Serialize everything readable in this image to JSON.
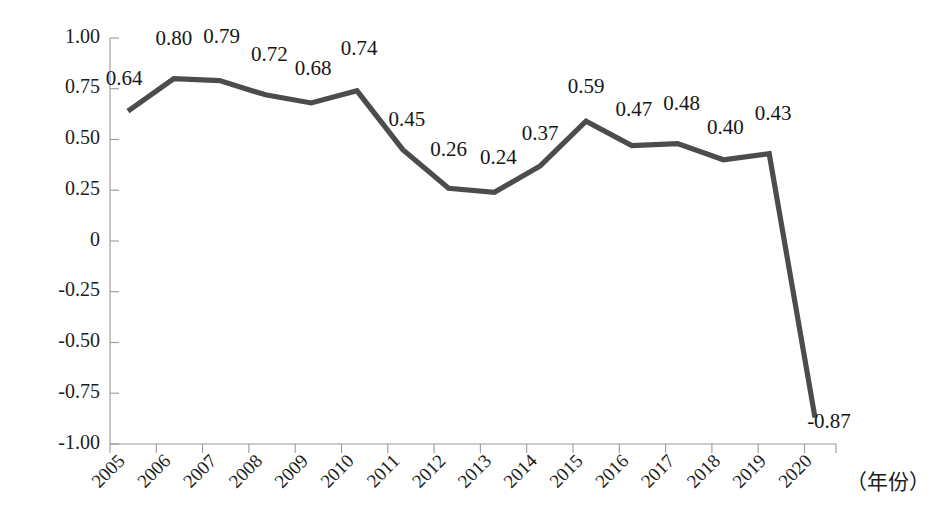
{
  "chart_data": {
    "type": "line",
    "title": "",
    "subtitle": "",
    "xlabel": "（年份）",
    "ylabel": "",
    "categories": [
      "2005",
      "2006",
      "2007",
      "2008",
      "2009",
      "2010",
      "2011",
      "2012",
      "2013",
      "2014",
      "2015",
      "2016",
      "2017",
      "2018",
      "2019",
      "2020"
    ],
    "values": [
      0.64,
      0.8,
      0.79,
      0.72,
      0.68,
      0.74,
      0.45,
      0.26,
      0.24,
      0.37,
      0.59,
      0.47,
      0.48,
      0.4,
      0.43,
      -0.87
    ],
    "data_labels": [
      "0.64",
      "0.80",
      "0.79",
      "0.72",
      "0.68",
      "0.74",
      "0.45",
      "0.26",
      "0.24",
      "0.37",
      "0.59",
      "0.47",
      "0.48",
      "0.40",
      "0.43",
      "-0.87"
    ],
    "ylim": [
      -1.0,
      1.0
    ],
    "yticks": [
      1.0,
      0.75,
      0.5,
      0.25,
      0,
      -0.25,
      -0.5,
      -0.75,
      -1.0
    ],
    "ytick_labels": [
      "1.00",
      "0.75",
      "0.50",
      "0.25",
      "0",
      "-0.25",
      "-0.50",
      "-0.75",
      "-1.00"
    ],
    "grid": false,
    "legend": false,
    "legend_position": "none",
    "series": [
      {
        "name": "",
        "color": "#4c4c4c",
        "values": [
          0.64,
          0.8,
          0.79,
          0.72,
          0.68,
          0.74,
          0.45,
          0.26,
          0.24,
          0.37,
          0.59,
          0.47,
          0.48,
          0.4,
          0.43,
          -0.87
        ]
      }
    ],
    "colors": {
      "line": "#4c4c4c",
      "axis": "#9a9a9a",
      "text": "#1c1c1c",
      "background": "#ffffff"
    }
  },
  "axis": {
    "x_title": "（年份）",
    "y_tick_0": "1.00",
    "y_tick_1": "0.75",
    "y_tick_2": "0.50",
    "y_tick_3": "0.25",
    "y_tick_4": "0",
    "y_tick_5": "-0.25",
    "y_tick_6": "-0.50",
    "y_tick_7": "-0.75",
    "y_tick_8": "-1.00"
  }
}
